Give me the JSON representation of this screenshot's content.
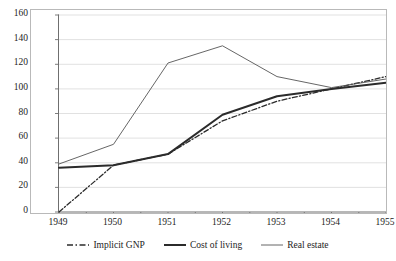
{
  "chart_data": {
    "type": "line",
    "title": "",
    "subtitle": "",
    "xlabel": "",
    "ylabel": "",
    "x": [
      1949,
      1950,
      1951,
      1952,
      1953,
      1954,
      1955
    ],
    "categories": [
      "1949",
      "1950",
      "1951",
      "1952",
      "1953",
      "1954",
      "1955"
    ],
    "xlim": [
      1949,
      1955
    ],
    "ylim": [
      0,
      160
    ],
    "ytick_labels": [
      "0",
      "20",
      "40",
      "60",
      "80",
      "100",
      "120",
      "140",
      "160"
    ],
    "ytick_values": [
      0,
      20,
      40,
      60,
      80,
      100,
      120,
      140,
      160
    ],
    "grid": "horizontal",
    "legend_position": "bottom",
    "series": [
      {
        "name": "Implicit GNP",
        "style": "dash-dot",
        "color": "#2b2b2b",
        "width": 1.3,
        "values": [
          0,
          38,
          47,
          74,
          90,
          100,
          110
        ]
      },
      {
        "name": "Cost of living",
        "style": "solid-thick",
        "color": "#2b2b2b",
        "width": 2.0,
        "values": [
          36,
          38,
          47,
          79,
          94,
          100,
          105
        ]
      },
      {
        "name": "Real estate",
        "style": "solid-thin",
        "color": "#555555",
        "width": 0.9,
        "values": [
          39,
          55,
          121,
          135,
          110,
          101,
          108
        ]
      }
    ]
  },
  "legend": {
    "items": [
      {
        "label": "Implicit GNP",
        "swatch": "dash-dot-swatch"
      },
      {
        "label": "Cost of living",
        "swatch": "thick-line-swatch"
      },
      {
        "label": "Real estate",
        "swatch": "thin-line-swatch"
      }
    ]
  },
  "axes": {
    "y_labels": [
      "160",
      "140",
      "120",
      "100",
      "80",
      "60",
      "40",
      "20",
      "0"
    ],
    "x_labels": [
      "1949",
      "1950",
      "1951",
      "1952",
      "1953",
      "1954",
      "1955"
    ]
  },
  "colors": {
    "frame": "#b9b9b9",
    "grid": "#d9d9d9",
    "axis": "#6f6f6f",
    "series_dark": "#2b2b2b",
    "series_light": "#555555",
    "background": "#ffffff",
    "text": "#1c1c1c"
  }
}
